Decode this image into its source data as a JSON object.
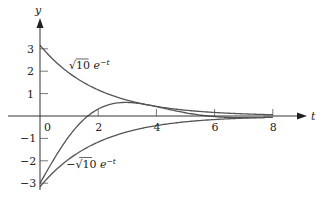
{
  "chart_data": {
    "type": "line",
    "title": "",
    "xlabel": "t",
    "ylabel": "y",
    "xlim": [
      -0.6,
      9.3
    ],
    "ylim": [
      -3.4,
      3.6
    ],
    "grid": false,
    "legend": null,
    "x_ticks": [
      0,
      2,
      4,
      6,
      8
    ],
    "x_tick_labels": [
      "0",
      "2",
      "4",
      "6",
      "8"
    ],
    "y_ticks": [
      3,
      2,
      1,
      -1,
      -2,
      -3
    ],
    "y_tick_labels": [
      "3",
      "2",
      "1",
      "−1",
      "−2",
      "−3"
    ],
    "x_tick_marks": [
      2,
      4,
      6,
      8
    ],
    "y_tick_marks": [
      3,
      2,
      1,
      -1,
      -2,
      -3
    ],
    "series": [
      {
        "name": "upper envelope",
        "formula": "sqrt(10) e^{-t/2}",
        "x": [
          0,
          1,
          2,
          3,
          4,
          5,
          6,
          7,
          8
        ],
        "values": [
          3.16,
          1.92,
          1.16,
          0.71,
          0.43,
          0.26,
          0.16,
          0.1,
          0.06
        ]
      },
      {
        "name": "solution curve",
        "formula": "sqrt(10) e^{-t/2} cos(0.76 t - 2.82)",
        "x": [
          0,
          1,
          2,
          3,
          4,
          5,
          6,
          7,
          8
        ],
        "values": [
          -3.0,
          -1.18,
          0.3,
          0.68,
          0.43,
          0.21,
          0.08,
          0.02,
          0.01
        ]
      },
      {
        "name": "lower envelope",
        "formula": "-sqrt(10) e^{-t/2}",
        "x": [
          0,
          1,
          2,
          3,
          4,
          5,
          6,
          7,
          8
        ],
        "values": [
          -3.16,
          -1.92,
          -1.16,
          -0.71,
          -0.43,
          -0.26,
          -0.16,
          -0.1,
          -0.06
        ]
      }
    ],
    "annotations": [
      {
        "text_base": "√10",
        "text_e": "e",
        "text_sup": "−t",
        "near_series": "upper envelope",
        "x": 1.0,
        "y": 2.1
      },
      {
        "text_base": "−√10",
        "text_e": "e",
        "text_sup": "−t",
        "near_series": "lower envelope",
        "x": 0.9,
        "y": -2.3
      }
    ]
  }
}
